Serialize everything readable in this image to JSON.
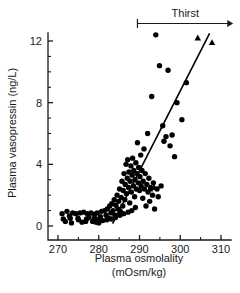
{
  "chart_data": {
    "type": "scatter",
    "title": "",
    "xlabel": "Plasma osmolality",
    "xlabel_units": "(mOsm/kg)",
    "ylabel": "Plasma vasopressin (ng/L)",
    "xlim": [
      265,
      312
    ],
    "ylim": [
      -0.6,
      13.2
    ],
    "xticks": [
      270,
      280,
      290,
      300,
      310
    ],
    "xtick_labels": [
      "270",
      "280",
      "290",
      "300",
      "310"
    ],
    "yticks": [
      0,
      4,
      8,
      12
    ],
    "ytick_labels": [
      "0",
      "4",
      "8",
      "12"
    ],
    "x_minor_ticks": [
      275,
      285,
      295,
      305
    ],
    "y_minor_ticks": [
      1,
      2,
      3,
      5,
      6,
      7,
      9,
      10,
      11
    ],
    "grid": false,
    "legend": false,
    "marker_color": "#000000",
    "line_color": "#000000",
    "axis_color": "#1a1a1a",
    "annotations": [
      {
        "name": "thirst-threshold-arrow",
        "label": "Thirst",
        "x_start": 289.5,
        "x_end": 313.0,
        "y": 13.6,
        "style": "arrow-right-with-left-cap"
      }
    ],
    "fit_line": {
      "name": "regression-line",
      "x_start": 283.4,
      "y_start": 0.15,
      "x_end": 307.2,
      "y_end": 12.5
    },
    "series": [
      {
        "name": "Normal subjects",
        "marker": "circle",
        "points": [
          [
            271.0,
            0.8
          ],
          [
            271.3,
            0.45
          ],
          [
            272.2,
            0.95
          ],
          [
            272.8,
            0.65
          ],
          [
            273.3,
            0.2
          ],
          [
            273.6,
            0.85
          ],
          [
            274.4,
            0.8
          ],
          [
            274.9,
            0.5
          ],
          [
            275.4,
            0.85
          ],
          [
            275.9,
            0.25
          ],
          [
            276.3,
            0.9
          ],
          [
            276.8,
            0.3
          ],
          [
            277.2,
            0.8
          ],
          [
            277.6,
            0.55
          ],
          [
            278.1,
            0.85
          ],
          [
            278.5,
            0.3
          ],
          [
            278.9,
            0.75
          ],
          [
            279.3,
            0.25
          ],
          [
            279.6,
            0.85
          ],
          [
            280.0,
            0.2
          ],
          [
            280.4,
            0.6
          ],
          [
            280.7,
            0.95
          ],
          [
            281.0,
            0.35
          ],
          [
            281.4,
            1.0
          ],
          [
            281.8,
            0.7
          ],
          [
            282.1,
            1.1
          ],
          [
            282.4,
            0.5
          ],
          [
            282.7,
            1.3
          ],
          [
            283.0,
            0.85
          ],
          [
            283.2,
            1.45
          ],
          [
            283.5,
            1.0
          ],
          [
            283.8,
            1.7
          ],
          [
            284.0,
            0.7
          ],
          [
            284.2,
            1.35
          ],
          [
            284.5,
            2.0
          ],
          [
            284.7,
            1.1
          ],
          [
            284.9,
            1.6
          ],
          [
            285.1,
            2.4
          ],
          [
            285.3,
            0.95
          ],
          [
            285.5,
            1.85
          ],
          [
            285.7,
            2.9
          ],
          [
            285.9,
            1.3
          ],
          [
            286.0,
            2.3
          ],
          [
            286.2,
            3.4
          ],
          [
            286.4,
            1.7
          ],
          [
            286.5,
            2.7
          ],
          [
            286.7,
            4.0
          ],
          [
            286.8,
            2.1
          ],
          [
            287.0,
            3.1
          ],
          [
            287.1,
            4.3
          ],
          [
            287.3,
            2.5
          ],
          [
            287.4,
            3.5
          ],
          [
            287.6,
            1.5
          ],
          [
            287.7,
            2.9
          ],
          [
            287.9,
            3.9
          ],
          [
            288.0,
            2.2
          ],
          [
            288.2,
            3.3
          ],
          [
            288.3,
            4.4
          ],
          [
            288.5,
            2.6
          ],
          [
            288.6,
            3.6
          ],
          [
            288.8,
            1.9
          ],
          [
            288.9,
            3.0
          ],
          [
            289.1,
            4.1
          ],
          [
            289.2,
            2.4
          ],
          [
            289.4,
            3.4
          ],
          [
            289.5,
            5.4
          ],
          [
            289.7,
            2.8
          ],
          [
            289.8,
            3.8
          ],
          [
            290.0,
            2.3
          ],
          [
            290.1,
            3.2
          ],
          [
            290.3,
            4.6
          ],
          [
            290.4,
            2.6
          ],
          [
            290.6,
            3.6
          ],
          [
            290.8,
            1.8
          ],
          [
            290.9,
            2.9
          ],
          [
            291.1,
            5.0
          ],
          [
            291.2,
            2.4
          ],
          [
            291.4,
            3.4
          ],
          [
            291.6,
            1.3
          ],
          [
            291.8,
            2.7
          ],
          [
            292.0,
            6.0
          ],
          [
            292.1,
            2.2
          ],
          [
            292.3,
            3.1
          ],
          [
            292.5,
            1.6
          ],
          [
            292.7,
            2.5
          ],
          [
            293.0,
            8.4
          ],
          [
            293.2,
            2.0
          ],
          [
            293.4,
            2.8
          ],
          [
            293.7,
            1.1
          ],
          [
            294.0,
            12.4
          ],
          [
            294.3,
            2.4
          ],
          [
            294.6,
            1.9
          ],
          [
            294.9,
            10.4
          ],
          [
            295.3,
            2.6
          ],
          [
            295.7,
            6.5
          ],
          [
            296.0,
            5.5
          ],
          [
            296.5,
            5.8
          ],
          [
            297.0,
            10.1
          ],
          [
            297.5,
            5.2
          ],
          [
            298.0,
            5.9
          ],
          [
            298.6,
            4.5
          ],
          [
            299.2,
            8.0
          ],
          [
            300.4,
            6.9
          ],
          [
            301.5,
            9.3
          ],
          [
            285.2,
            0.7
          ],
          [
            286.1,
            0.8
          ],
          [
            287.2,
            0.9
          ],
          [
            288.1,
            1.0
          ],
          [
            289.0,
            1.2
          ],
          [
            284.1,
            0.55
          ],
          [
            283.1,
            0.45
          ],
          [
            282.0,
            0.4
          ],
          [
            280.2,
            0.45
          ],
          [
            279.0,
            0.5
          ],
          [
            277.0,
            0.45
          ],
          [
            275.0,
            0.4
          ],
          [
            273.0,
            0.5
          ],
          [
            271.8,
            0.3
          ]
        ]
      },
      {
        "name": "Dehydrated subjects",
        "marker": "triangle",
        "points": [
          [
            292.6,
            2.4
          ],
          [
            293.6,
            2.5
          ],
          [
            304.3,
            12.2
          ],
          [
            307.8,
            11.9
          ]
        ]
      }
    ]
  },
  "figure": {
    "background": "#ffffff",
    "width": 240,
    "height": 293
  }
}
